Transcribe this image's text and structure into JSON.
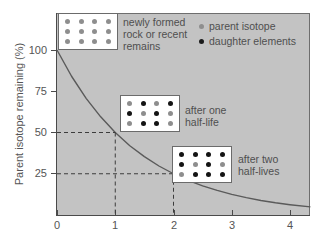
{
  "chart_data": {
    "type": "line",
    "title": "",
    "xlabel": "",
    "ylabel": "Parent isotope remaining (%)",
    "xlim": [
      0,
      4.35
    ],
    "ylim": [
      0,
      108
    ],
    "grid": false,
    "legend_position": "top-right",
    "x_ticks": [
      "0",
      "1",
      "2",
      "3",
      "4"
    ],
    "x_tick_values": [
      0,
      1,
      2,
      3,
      4
    ],
    "y_ticks": [
      "25",
      "50",
      "75",
      "100"
    ],
    "y_tick_values": [
      25,
      50,
      75,
      100
    ],
    "series": [
      {
        "name": "parent isotope remaining",
        "x": [
          0,
          0.25,
          0.5,
          0.75,
          1,
          1.25,
          1.5,
          1.75,
          2,
          2.25,
          2.5,
          2.75,
          3,
          3.25,
          3.5,
          3.75,
          4,
          4.35
        ],
        "values": [
          100,
          84.1,
          70.7,
          59.5,
          50,
          42.0,
          35.4,
          29.7,
          25,
          21.0,
          17.7,
          14.9,
          12.5,
          10.5,
          8.8,
          7.4,
          6.25,
          4.9
        ]
      }
    ],
    "guides": [
      {
        "label": "one half-life",
        "x": 1,
        "y": 50
      },
      {
        "label": "two half-lives",
        "x": 2,
        "y": 25
      }
    ]
  },
  "legend": {
    "items": [
      {
        "label": "parent isotope",
        "marker": "parent",
        "color": "#8e8e8e"
      },
      {
        "label": "daughter elements",
        "marker": "daughter",
        "color": "#1b1b1b"
      }
    ]
  },
  "annotations": {
    "newly_formed": "newly formed\nrock or recent\nremains",
    "after_one": "after one\nhalf-life",
    "after_two": "after two\nhalf-lives"
  },
  "specimens": [
    {
      "name": "specimen-newly-formed",
      "parent_count": 12,
      "daughter_count": 0,
      "dots": [
        "parent",
        "parent",
        "parent",
        "parent",
        "parent",
        "parent",
        "parent",
        "parent",
        "parent",
        "parent",
        "parent",
        "parent"
      ]
    },
    {
      "name": "specimen-after-one-half-life",
      "parent_count": 6,
      "daughter_count": 6,
      "dots": [
        "parent",
        "daughter",
        "parent",
        "daughter",
        "daughter",
        "parent",
        "daughter",
        "parent",
        "parent",
        "daughter",
        "daughter",
        "parent"
      ]
    },
    {
      "name": "specimen-after-two-half-lives",
      "parent_count": 3,
      "daughter_count": 9,
      "dots": [
        "daughter",
        "daughter",
        "daughter",
        "daughter",
        "daughter",
        "parent",
        "daughter",
        "parent",
        "parent",
        "daughter",
        "daughter",
        "daughter"
      ]
    }
  ],
  "colors": {
    "plot_background": "#c3c3c3",
    "curve": "#5a5a5a",
    "guide": "#3c3c3c",
    "axis": "#4a4a4a",
    "parent": "#8e8e8e",
    "daughter": "#141414"
  }
}
